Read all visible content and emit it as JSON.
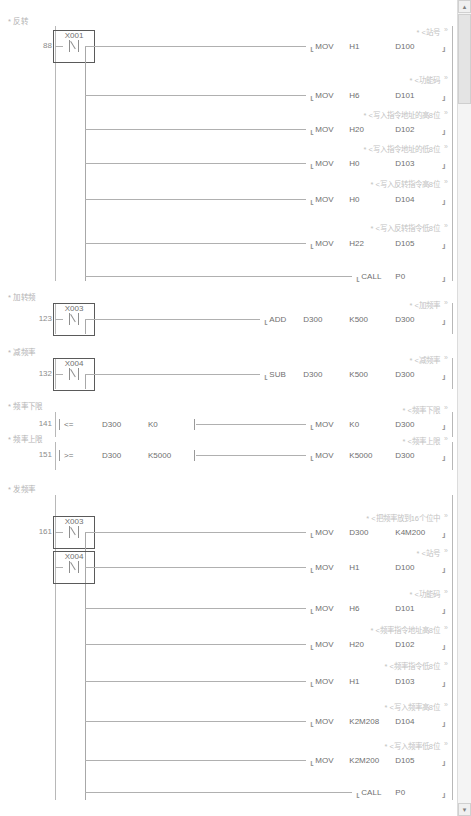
{
  "document": {
    "type": "plc-ladder-diagram",
    "title": "Ladder Logic Program"
  },
  "scrollbar": {
    "up_arrow": "▴",
    "down_arrow": "▾"
  },
  "sections": [
    {
      "id": "reverse",
      "title": "* 反转",
      "step": "88",
      "contact": {
        "name": "X001",
        "type": "rising-pulse"
      },
      "rungs": [
        {
          "comment": "* <站号",
          "op": "MOV",
          "args": [
            "H1",
            "D100"
          ]
        },
        {
          "comment": "* <功能码",
          "op": "MOV",
          "args": [
            "H6",
            "D101"
          ]
        },
        {
          "comment": "* <写入指令地址的高8位",
          "op": "MOV",
          "args": [
            "H20",
            "D102"
          ]
        },
        {
          "comment": "* <写入指令地址的低8位",
          "op": "MOV",
          "args": [
            "H0",
            "D103"
          ]
        },
        {
          "comment": "* <写入反转指令高8位",
          "op": "MOV",
          "args": [
            "H0",
            "D104"
          ]
        },
        {
          "comment": "* <写入反转指令低8位",
          "op": "MOV",
          "args": [
            "H22",
            "D105"
          ]
        },
        {
          "comment": "",
          "op": "CALL",
          "args": [
            "P0"
          ]
        }
      ]
    },
    {
      "id": "add-freq",
      "title": "* 加转频",
      "step": "123",
      "contact": {
        "name": "X003",
        "type": "rising-pulse"
      },
      "rungs": [
        {
          "comment": "* <加频率",
          "op": "ADD",
          "args": [
            "D300",
            "K500",
            "D300"
          ]
        }
      ]
    },
    {
      "id": "sub-freq",
      "title": "* 减频率",
      "step": "132",
      "contact": {
        "name": "X004",
        "type": "rising-pulse"
      },
      "rungs": [
        {
          "comment": "* <减频率",
          "op": "SUB",
          "args": [
            "D300",
            "K500",
            "D300"
          ]
        }
      ]
    },
    {
      "id": "freq-low-limit",
      "title": "* 频率下限",
      "step": "141",
      "compare": {
        "op": "<=",
        "args": [
          "D300",
          "K0"
        ]
      },
      "rungs": [
        {
          "comment": "* <频率下限",
          "op": "MOV",
          "args": [
            "K0",
            "D300"
          ]
        }
      ]
    },
    {
      "id": "freq-high-limit",
      "title": "* 频率上限",
      "step": "151",
      "compare": {
        "op": ">=",
        "args": [
          "D300",
          "K5000"
        ]
      },
      "rungs": [
        {
          "comment": "* <频率上限",
          "op": "MOV",
          "args": [
            "K5000",
            "D300"
          ]
        }
      ]
    },
    {
      "id": "send-freq",
      "title": "* 发频率",
      "step": "161",
      "contact": {
        "name": "X003",
        "type": "rising-pulse"
      },
      "contact2": {
        "name": "X004",
        "type": "rising-pulse"
      },
      "rungs": [
        {
          "comment": "* <把频率放到16个位中",
          "op": "MOV",
          "args": [
            "D300",
            "K4M200"
          ]
        },
        {
          "comment": "* <站号",
          "op": "MOV",
          "args": [
            "H1",
            "D100"
          ]
        },
        {
          "comment": "* <功能码",
          "op": "MOV",
          "args": [
            "H6",
            "D101"
          ]
        },
        {
          "comment": "* <频率指令地址高8位",
          "op": "MOV",
          "args": [
            "H20",
            "D102"
          ]
        },
        {
          "comment": "* <频率指令低8位",
          "op": "MOV",
          "args": [
            "H1",
            "D103"
          ]
        },
        {
          "comment": "* <写入频率高8位",
          "op": "MOV",
          "args": [
            "K2M208",
            "D104"
          ]
        },
        {
          "comment": "* <写入频率低8位",
          "op": "MOV",
          "args": [
            "K2M200",
            "D105"
          ]
        },
        {
          "comment": "",
          "op": "CALL",
          "args": [
            "P0"
          ]
        }
      ]
    }
  ],
  "colors": {
    "wire": "#b0b0b0",
    "text": "#6f6f6f",
    "comment": "#c2c2c2",
    "title": "#b4b4b4",
    "background": "#ffffff"
  }
}
